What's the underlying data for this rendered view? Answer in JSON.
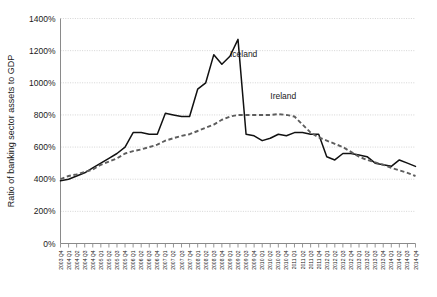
{
  "chart_data": {
    "type": "line",
    "title": "",
    "xlabel": "",
    "ylabel": "Ratio of banking sector assets to GDP",
    "ylim": [
      0,
      1400
    ],
    "ytick_labels": [
      "0%",
      "200%",
      "400%",
      "600%",
      "800%",
      "1000%",
      "1200%",
      "1400%"
    ],
    "ytick_values": [
      0,
      200,
      400,
      600,
      800,
      1000,
      1200,
      1400
    ],
    "grid": true,
    "legend_position": "inline-annotation",
    "categories": [
      "2003 Q4",
      "2004 Q1",
      "2004 Q2",
      "2004 Q3",
      "2004 Q4",
      "2005 Q1",
      "2005 Q2",
      "2005 Q3",
      "2005 Q4",
      "2006 Q1",
      "2006 Q2",
      "2006 Q3",
      "2006 Q4",
      "2007 Q1",
      "2007 Q2",
      "2007 Q3",
      "2007 Q4",
      "2008 Q1",
      "2008 Q2",
      "2008 Q3",
      "2008 Q4",
      "2009 Q1",
      "2009 Q2",
      "2009 Q3",
      "2009 Q4",
      "2010 Q1",
      "2010 Q2",
      "2010 Q3",
      "2010 Q4",
      "2011 Q1",
      "2011 Q2",
      "2011 Q3",
      "2011 Q4",
      "2012 Q1",
      "2012 Q2",
      "2012 Q3",
      "2012 Q4",
      "2013 Q1",
      "2013 Q2",
      "2013 Q3",
      "2013 Q4",
      "2014 Q1",
      "2014 Q2",
      "2014 Q3",
      "2014 Q4"
    ],
    "series": [
      {
        "name": "Iceland",
        "style": "solid",
        "color": "#111111",
        "label_x_index": 21,
        "label_y_value": 1160,
        "values": [
          390,
          400,
          420,
          440,
          470,
          500,
          530,
          560,
          600,
          690,
          690,
          680,
          680,
          810,
          800,
          790,
          790,
          960,
          1000,
          1175,
          1115,
          1165,
          1270,
          680,
          670,
          640,
          655,
          680,
          670,
          690,
          690,
          680,
          680,
          540,
          520,
          560,
          560,
          550,
          540,
          500,
          490,
          480,
          520,
          500,
          480
        ]
      },
      {
        "name": "Ireland",
        "style": "dashed",
        "color": "#5d5d5d",
        "label_x_index": 26,
        "label_y_value": 900,
        "values": [
          400,
          420,
          430,
          445,
          460,
          490,
          510,
          530,
          560,
          575,
          585,
          600,
          615,
          640,
          655,
          670,
          680,
          700,
          720,
          740,
          770,
          790,
          800,
          800,
          800,
          800,
          800,
          805,
          800,
          790,
          740,
          690,
          660,
          640,
          620,
          600,
          570,
          540,
          520,
          505,
          490,
          470,
          455,
          440,
          420
        ]
      }
    ]
  },
  "axis": {
    "y_title": "Ratio of banking sector assets to GDP"
  }
}
